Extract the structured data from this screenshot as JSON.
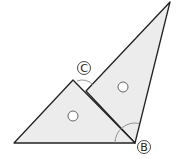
{
  "diagram": {
    "labels": {
      "C": "C",
      "B": "B"
    },
    "colors": {
      "fill": "#ececec",
      "stroke": "#222222",
      "arc": "#888888"
    },
    "markers": [
      {
        "name": "angle-marker-small-triangle",
        "symbol": "circle"
      },
      {
        "name": "angle-marker-large-triangle",
        "symbol": "circle"
      }
    ]
  }
}
